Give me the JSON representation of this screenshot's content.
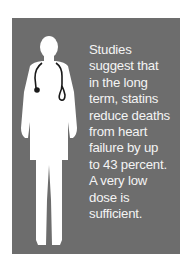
{
  "colors": {
    "panel": "#6d6d6d",
    "text": "#f4f4f4",
    "silhouette": "#ffffff",
    "stethoscope": "#1a1a1a"
  },
  "illustration": {
    "icon": "doctor-with-stethoscope-icon"
  },
  "caption": {
    "lines": [
      "Studies",
      "suggest that",
      "in the long",
      "term, statins",
      "reduce deaths",
      "from heart",
      "failure by up",
      "to 43 percent.",
      "A very low",
      "dose is",
      "sufficient."
    ]
  }
}
